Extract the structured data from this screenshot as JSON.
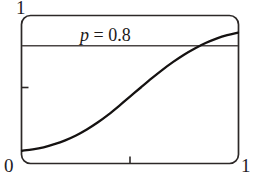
{
  "figure": {
    "annotation_var": "p",
    "annotation_rest": " = 0.8",
    "annotation_full": "p = 0.8",
    "labels": {
      "y_max": "1",
      "origin": "0",
      "x_max": "1"
    },
    "colors": {
      "ink": "#1d1a19",
      "frame": "#2c2827",
      "curve": "#151211",
      "reference_line": "#4a4544",
      "background": "#ffffff"
    }
  },
  "chart_data": {
    "type": "line",
    "title": "",
    "subtitle": "",
    "xlabel": "",
    "ylabel": "",
    "xlim": [
      0,
      1
    ],
    "ylim": [
      0,
      1
    ],
    "xticks": [
      0,
      0.5,
      1
    ],
    "xticklabels": [
      "0",
      "",
      "1"
    ],
    "yticks": [
      0,
      0.5,
      1
    ],
    "yticklabels": [
      "0",
      "",
      "1"
    ],
    "grid": false,
    "legend": null,
    "annotations": [
      {
        "text": "p = 0.8",
        "x": 0.5,
        "y": 0.88,
        "style": "italic-variable"
      }
    ],
    "reference_lines": [
      {
        "name": "p",
        "orientation": "horizontal",
        "value": 0.8,
        "label": "p = 0.8"
      }
    ],
    "series": [
      {
        "name": "cumulative-curve",
        "type": "line",
        "x": [
          0.0,
          0.05,
          0.1,
          0.15,
          0.2,
          0.25,
          0.3,
          0.35,
          0.4,
          0.45,
          0.5,
          0.55,
          0.6,
          0.65,
          0.7,
          0.75,
          0.8,
          0.85,
          0.9,
          0.95,
          1.0
        ],
        "y": [
          0.045,
          0.055,
          0.07,
          0.092,
          0.12,
          0.155,
          0.198,
          0.248,
          0.305,
          0.368,
          0.434,
          0.5,
          0.565,
          0.627,
          0.684,
          0.736,
          0.781,
          0.82,
          0.852,
          0.877,
          0.895
        ]
      }
    ],
    "intersections": [
      {
        "description": "curve crosses p = 0.8 reference line",
        "x": 0.79,
        "y": 0.8
      }
    ]
  }
}
